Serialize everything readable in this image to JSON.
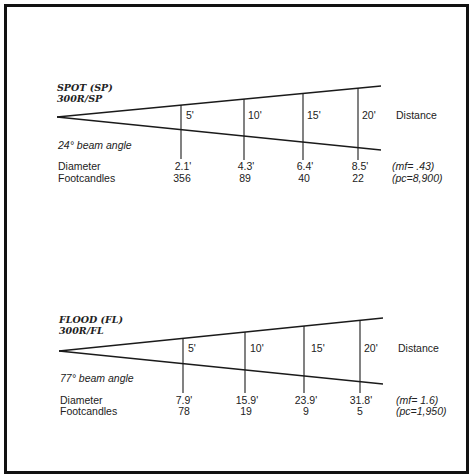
{
  "diagrams": [
    {
      "title": "SPOT (SP)",
      "model": "300R/SP",
      "beam_angle": "24° beam angle",
      "distance_label": "Distance",
      "diameter_label": "Diameter",
      "footcandles_label": "Footcandles",
      "distances": [
        "5'",
        "10'",
        "15'",
        "20'"
      ],
      "diameters": [
        "2.1'",
        "4.3'",
        "6.4'",
        "8.5'"
      ],
      "footcandles": [
        "356",
        "89",
        "40",
        "22"
      ],
      "mf": "(mf= .43)",
      "pc": "(pc=8,900)"
    },
    {
      "title": "FLOOD  (FL)",
      "model": "300R/FL",
      "beam_angle": "77° beam angle",
      "distance_label": "Distance",
      "diameter_label": "Diameter",
      "footcandles_label": "Footcandles",
      "distances": [
        "5'",
        "10'",
        "15'",
        "20'"
      ],
      "diameters": [
        "7.9'",
        "15.9'",
        "23.9'",
        "31.8'"
      ],
      "footcandles": [
        "78",
        "19",
        "9",
        "5"
      ],
      "mf": "(mf= 1.6)",
      "pc": "(pc=1,950)"
    }
  ],
  "colors": {
    "line": "#1a1a1a",
    "text": "#222222",
    "background": "#ffffff"
  }
}
